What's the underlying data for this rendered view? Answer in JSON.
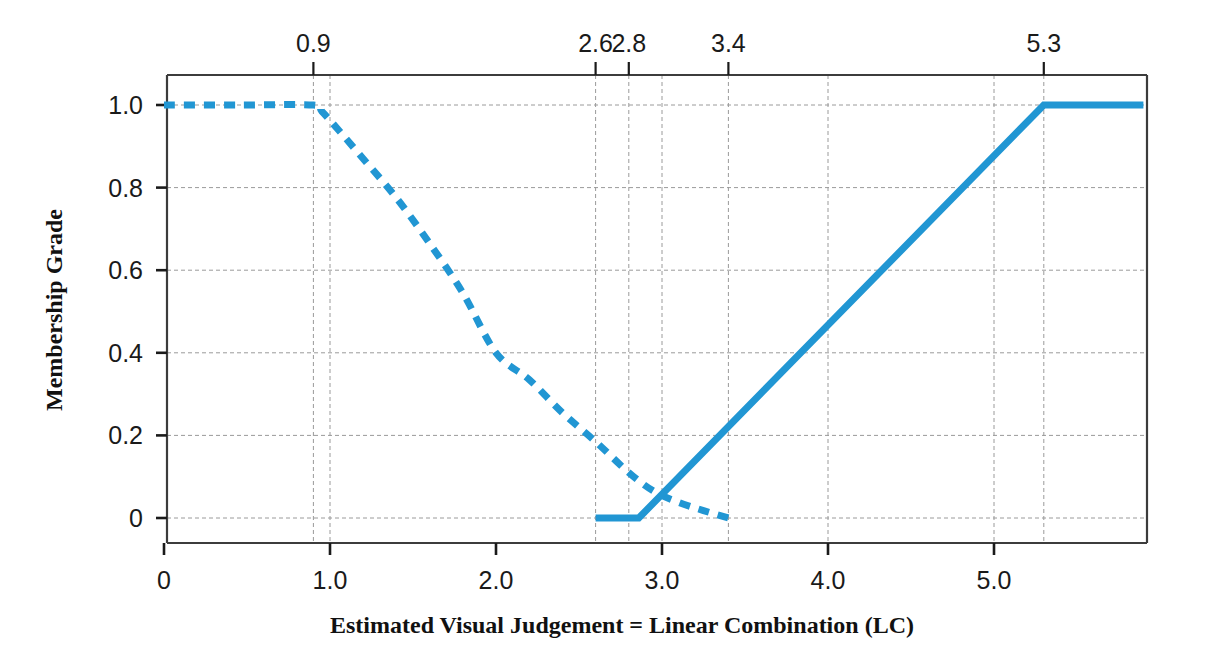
{
  "chart_data": {
    "type": "line",
    "title": "",
    "xlabel": "Estimated Visual Judgement = Linear Combination (LC)",
    "ylabel": "Membership Grade",
    "xlim": [
      0,
      5.9
    ],
    "ylim": [
      0,
      1.04
    ],
    "grid": true,
    "legend": "none",
    "x_ticks": [
      {
        "value": 0,
        "label": "0"
      },
      {
        "value": 1.0,
        "label": "1.0"
      },
      {
        "value": 2.0,
        "label": "2.0"
      },
      {
        "value": 3.0,
        "label": "3.0"
      },
      {
        "value": 4.0,
        "label": "4.0"
      },
      {
        "value": 5.0,
        "label": "5.0"
      }
    ],
    "y_ticks": [
      {
        "value": 1.0,
        "label": "1.0"
      },
      {
        "value": 0.8,
        "label": "0.8"
      },
      {
        "value": 0.6,
        "label": "0.6"
      },
      {
        "value": 0.4,
        "label": "0.4"
      },
      {
        "value": 0.2,
        "label": "0.2"
      },
      {
        "value": 0.0,
        "label": "0"
      }
    ],
    "top_axis_ticks": [
      {
        "value": 0.9,
        "label": "0.9"
      },
      {
        "value": 2.6,
        "label": "2.6"
      },
      {
        "value": 2.8,
        "label": "2.8"
      },
      {
        "value": 3.4,
        "label": "3.4"
      },
      {
        "value": 5.3,
        "label": "5.3"
      }
    ],
    "vertical_gridlines": [
      0.9,
      1.0,
      2.6,
      2.8,
      3.0,
      3.4,
      4.0,
      5.0,
      5.3
    ],
    "horizontal_gridlines": [
      0.0,
      0.2,
      0.4,
      0.6,
      0.8,
      1.0
    ],
    "series": [
      {
        "name": "descending-membership",
        "style": "dashed",
        "color": "#2196d3",
        "points": [
          [
            0.0,
            1.0
          ],
          [
            0.45,
            1.0
          ],
          [
            0.9,
            1.0
          ],
          [
            0.95,
            0.985
          ],
          [
            1.05,
            0.94
          ],
          [
            1.2,
            0.87
          ],
          [
            1.4,
            0.775
          ],
          [
            1.6,
            0.665
          ],
          [
            1.8,
            0.545
          ],
          [
            2.0,
            0.4
          ],
          [
            2.2,
            0.335
          ],
          [
            2.4,
            0.255
          ],
          [
            2.6,
            0.185
          ],
          [
            2.8,
            0.11
          ],
          [
            2.95,
            0.065
          ],
          [
            3.1,
            0.038
          ],
          [
            3.25,
            0.018
          ],
          [
            3.4,
            0.0
          ]
        ]
      },
      {
        "name": "ascending-membership",
        "style": "solid",
        "color": "#2196d3",
        "points": [
          [
            2.6,
            0.0
          ],
          [
            2.86,
            0.0
          ],
          [
            5.3,
            1.0
          ],
          [
            5.9,
            1.0
          ]
        ]
      }
    ]
  },
  "axes": {
    "y_title": "Membership Grade",
    "x_title": "Estimated Visual Judgement = Linear Combination (LC)"
  },
  "colors": {
    "series_blue": "#2196d3",
    "axis": "#3c3c3c",
    "grid": "#9a9a9a",
    "text": "#1a1a1a",
    "background": "#ffffff"
  }
}
